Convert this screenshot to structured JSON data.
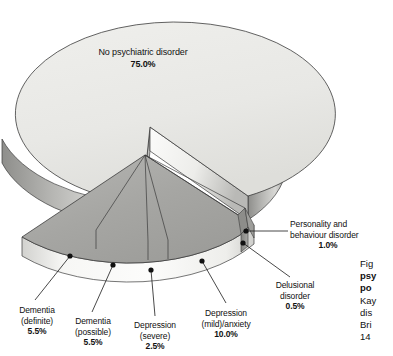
{
  "figure": {
    "background_color": "#ffffff",
    "caption_lines": [
      "Fig",
      "psy",
      "po",
      "Kay",
      "dis",
      "Bri",
      "14"
    ],
    "caption_bold_flags": [
      false,
      true,
      true,
      false,
      false,
      false,
      false
    ]
  },
  "chart_data": {
    "type": "pie",
    "title": "",
    "subtitle": "",
    "xlabel": "",
    "ylabel": "",
    "legend_position": "none",
    "grid": false,
    "style": "3d-exploded-pie",
    "units": "percent",
    "total": 100.0,
    "categories": [
      "No psychiatric disorder",
      "Dementia (definite)",
      "Dementia (possible)",
      "Depression (severe)",
      "Depression (mild)/anxiety",
      "Personality and behaviour disorder",
      "Delusional disorder"
    ],
    "values": [
      75.0,
      5.5,
      5.5,
      2.5,
      10.0,
      1.0,
      0.5
    ],
    "value_labels": [
      "75.0%",
      "5.5%",
      "5.5%",
      "2.5%",
      "10.0%",
      "1.0%",
      "0.5%"
    ],
    "slice_colors": [
      "#e9e9e6",
      "#a9a9a6",
      "#a9a9a6",
      "#a9a9a6",
      "#a9a9a6",
      "#8f8f8c",
      "#8f8f8c"
    ],
    "exploded": [
      false,
      true,
      true,
      true,
      true,
      true,
      true
    ]
  },
  "labels": {
    "main_slice": {
      "name": "No psychiatric disorder",
      "percent": "75.0%"
    },
    "dementia_definite": {
      "line1": "Dementia",
      "line2": "(definite)",
      "percent": "5.5%"
    },
    "dementia_possible": {
      "line1": "Dementia",
      "line2": "(possible)",
      "percent": "5.5%"
    },
    "depression_severe": {
      "line1": "Depression",
      "line2": "(severe)",
      "percent": "2.5%"
    },
    "depression_mild": {
      "line1": "Depression",
      "line2": "(mild)/anxiety",
      "percent": "10.0%"
    },
    "delusional": {
      "line1": "Delusional",
      "line2": "disorder",
      "percent": "0.5%"
    },
    "personality": {
      "line1": "Personality and",
      "line2": "behaviour disorder",
      "percent": "1.0%"
    }
  }
}
